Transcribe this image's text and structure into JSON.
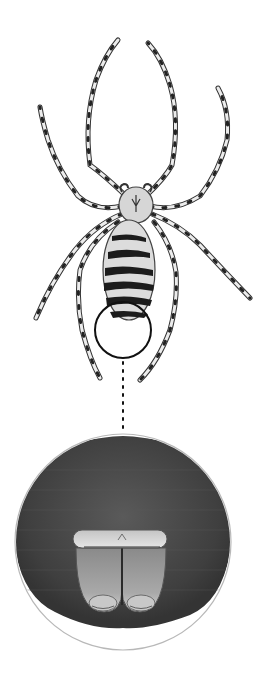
{
  "illustration": {
    "subject": "spider",
    "views": [
      "dorsal-view",
      "magnified-spinnerets-detail"
    ],
    "colors": {
      "background": "#ffffff",
      "ink": "#1a1a1a",
      "leg_fill": "#e9e9e9",
      "body_fill": "#d8d8d8",
      "stripe": "#1c1c1c",
      "detail_bg": "#4a4a4a",
      "detail_ring": "#b8b8b8",
      "spinneret_fill": "#9a9a9a"
    },
    "callout": {
      "marker_circle": {
        "cx": 123,
        "cy": 330,
        "r": 28
      },
      "connector": "dotted-line",
      "detail_circle": {
        "cx": 123,
        "cy": 542,
        "r": 108
      }
    }
  }
}
